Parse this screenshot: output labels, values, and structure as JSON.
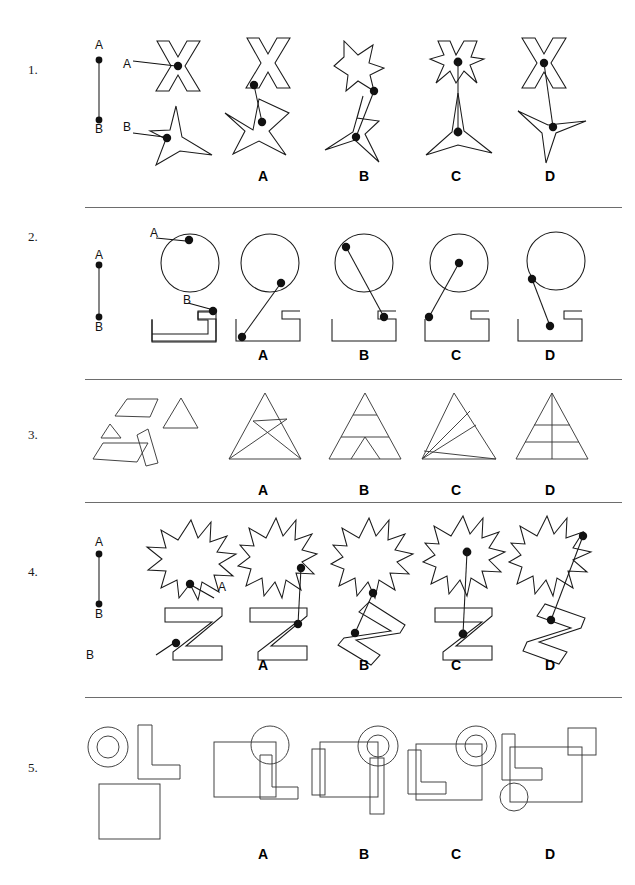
{
  "page": {
    "width": 635,
    "height": 885,
    "background": "#ffffff",
    "ink": "#1a1a1a"
  },
  "option_labels": [
    "A",
    "B",
    "C",
    "D"
  ],
  "point_labels": {
    "a": "A",
    "b": "B"
  },
  "questions": [
    {
      "number": "1.",
      "prompt_shapes": [
        "x-cross-shape",
        "three-point-star-shape"
      ],
      "prompt_point_labels": [
        "A",
        "B"
      ],
      "reference": "line-segment-A-to-B",
      "options": [
        {
          "label": "A",
          "shapes": [
            "x-cross-shape",
            "three-point-star-shape"
          ]
        },
        {
          "label": "B",
          "shapes": [
            "x-cross-shape",
            "three-point-star-shape"
          ]
        },
        {
          "label": "C",
          "shapes": [
            "x-cross-shape",
            "three-point-star-shape"
          ]
        },
        {
          "label": "D",
          "shapes": [
            "x-cross-shape",
            "three-point-star-shape"
          ]
        }
      ]
    },
    {
      "number": "2.",
      "prompt_shapes": [
        "circle-shape",
        "bracket-block-shape"
      ],
      "prompt_point_labels": [
        "A",
        "B"
      ],
      "reference": "line-segment-A-to-B",
      "options": [
        {
          "label": "A",
          "shapes": [
            "circle-shape",
            "bracket-block-shape"
          ]
        },
        {
          "label": "B",
          "shapes": [
            "circle-shape",
            "bracket-block-shape"
          ]
        },
        {
          "label": "C",
          "shapes": [
            "circle-shape",
            "bracket-block-shape"
          ]
        },
        {
          "label": "D",
          "shapes": [
            "circle-shape",
            "bracket-block-shape"
          ]
        }
      ]
    },
    {
      "number": "3.",
      "prompt_shapes": [
        "trapezoid-shape",
        "large-triangle-shape",
        "small-triangle-shape",
        "parallelogram-shape",
        "slanted-parallelogram-shape"
      ],
      "options": [
        {
          "label": "A",
          "shapes": [
            "triangle-with-crossing-lines"
          ]
        },
        {
          "label": "B",
          "shapes": [
            "triangle-with-bands-and-peak"
          ]
        },
        {
          "label": "C",
          "shapes": [
            "triangle-with-slanted-bands"
          ]
        },
        {
          "label": "D",
          "shapes": [
            "triangle-with-grid-lines"
          ]
        }
      ]
    },
    {
      "number": "4.",
      "prompt_shapes": [
        "ten-point-burst-shape",
        "letter-z-block-shape"
      ],
      "prompt_point_labels": [
        "A",
        "B"
      ],
      "reference": "line-segment-A-to-B",
      "options": [
        {
          "label": "A",
          "shapes": [
            "ten-point-burst-shape",
            "letter-z-block-shape"
          ]
        },
        {
          "label": "B",
          "shapes": [
            "ten-point-burst-shape",
            "letter-z-block-shape"
          ]
        },
        {
          "label": "C",
          "shapes": [
            "ten-point-burst-shape",
            "letter-z-block-shape"
          ]
        },
        {
          "label": "D",
          "shapes": [
            "ten-point-burst-shape",
            "letter-z-block-shape"
          ]
        }
      ]
    },
    {
      "number": "5.",
      "prompt_shapes": [
        "annulus-ring-shape",
        "letter-l-block-shape",
        "square-shape"
      ],
      "options": [
        {
          "label": "A",
          "shapes": [
            "square-shape",
            "circle-shape",
            "letter-l-block-shape"
          ]
        },
        {
          "label": "B",
          "shapes": [
            "square-shape",
            "annulus-ring-shape",
            "two-narrow-rectangles"
          ]
        },
        {
          "label": "C",
          "shapes": [
            "square-shape",
            "annulus-ring-shape",
            "letter-l-block-shape"
          ]
        },
        {
          "label": "D",
          "shapes": [
            "square-shape",
            "letter-l-block-shape",
            "small-square-shape",
            "small-circle-shape"
          ]
        }
      ]
    }
  ]
}
